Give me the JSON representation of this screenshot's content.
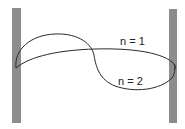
{
  "diagram": {
    "type": "standing-wave-modes",
    "walls": [
      {
        "id": "left",
        "x": 12,
        "y": 8,
        "width": 9,
        "height": 115,
        "color": "#8c8c8c"
      },
      {
        "id": "right",
        "x": 169,
        "y": 9,
        "width": 8,
        "height": 114,
        "color": "#8c8c8c"
      }
    ],
    "curves": [
      {
        "id": "n1",
        "label": "n = 1",
        "label_x": 120,
        "label_y": 36
      },
      {
        "id": "n2",
        "label": "n = 2",
        "label_x": 118,
        "label_y": 76
      }
    ],
    "stroke_color": "#2a2a2a"
  }
}
